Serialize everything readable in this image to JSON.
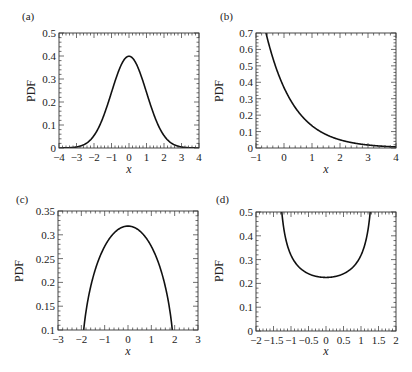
{
  "figure": {
    "colors": {
      "curve": "#111111",
      "frame": "#333333",
      "background": "#ffffff"
    }
  },
  "chart_data": [
    {
      "panel": "(a)",
      "type": "line",
      "title": "",
      "xlabel": "x",
      "ylabel": "PDF",
      "xlim": [
        -4,
        4
      ],
      "ylim": [
        0,
        0.5
      ],
      "xticks": [
        -4,
        -3,
        -2,
        -1,
        0,
        1,
        2,
        3,
        4
      ],
      "xtick_labels": [
        "−4",
        "−3",
        "−2",
        "−1",
        "0",
        "1",
        "2",
        "3",
        "4"
      ],
      "yticks": [
        0,
        0.1,
        0.2,
        0.3,
        0.4,
        0.5
      ],
      "ytick_labels": [
        "0",
        "0.1",
        "0.2",
        "0.3",
        "0.4",
        "0.5"
      ],
      "grid": false,
      "description": "Standard normal PDF, peak 0.399 at x=0",
      "x": [
        -4,
        -3.5,
        -3,
        -2.5,
        -2,
        -1.5,
        -1,
        -0.5,
        0,
        0.5,
        1,
        1.5,
        2,
        2.5,
        3,
        3.5,
        4
      ],
      "values": [
        0.0001,
        0.0009,
        0.0044,
        0.0175,
        0.054,
        0.1295,
        0.242,
        0.352,
        0.399,
        0.352,
        0.242,
        0.1295,
        0.054,
        0.0175,
        0.0044,
        0.0009,
        0.0001
      ]
    },
    {
      "panel": "(b)",
      "type": "line",
      "title": "",
      "xlabel": "x",
      "ylabel": "PDF",
      "xlim": [
        -1,
        4
      ],
      "ylim": [
        0,
        0.7
      ],
      "xticks": [
        -1,
        0,
        1,
        2,
        3,
        4
      ],
      "xtick_labels": [
        "−1",
        "0",
        "1",
        "2",
        "3",
        "4"
      ],
      "yticks": [
        0,
        0.1,
        0.2,
        0.3,
        0.4,
        0.5,
        0.6,
        0.7
      ],
      "ytick_labels": [
        "0",
        "0.1",
        "0.2",
        "0.3",
        "0.4",
        "0.5",
        "0.6",
        "0.7"
      ],
      "grid": false,
      "description": "Shifted exponential PDF exp(-(x+1)), exits top of frame near x=-0.65",
      "x": [
        -0.65,
        -0.5,
        0,
        0.5,
        1,
        1.5,
        2,
        2.5,
        3,
        3.5,
        4
      ],
      "values": [
        0.705,
        0.607,
        0.368,
        0.223,
        0.135,
        0.082,
        0.05,
        0.03,
        0.018,
        0.011,
        0.007
      ]
    },
    {
      "panel": "(c)",
      "type": "line",
      "title": "",
      "xlabel": "x",
      "ylabel": "PDF",
      "xlim": [
        -3,
        3
      ],
      "ylim": [
        0.1,
        0.35
      ],
      "xticks": [
        -3,
        -2,
        -1,
        0,
        1,
        2,
        3
      ],
      "xtick_labels": [
        "−3",
        "−2",
        "−1",
        "0",
        "1",
        "2",
        "3"
      ],
      "yticks": [
        0.1,
        0.15,
        0.2,
        0.25,
        0.3,
        0.35
      ],
      "ytick_labels": [
        "0.1",
        "0.15",
        "0.2",
        "0.25",
        "0.3",
        "0.35"
      ],
      "grid": false,
      "description": "Semicircle PDF sqrt(4-x^2)/(2*pi), peak 0.318 at x=0, crosses 0.1 near x=±1.9",
      "x": [
        -1.9,
        -1.75,
        -1.5,
        -1.25,
        -1,
        -0.75,
        -0.5,
        -0.25,
        0,
        0.25,
        0.5,
        0.75,
        1,
        1.25,
        1.5,
        1.75,
        1.9
      ],
      "values": [
        0.099,
        0.154,
        0.21,
        0.248,
        0.276,
        0.295,
        0.308,
        0.316,
        0.318,
        0.316,
        0.308,
        0.295,
        0.276,
        0.248,
        0.21,
        0.154,
        0.099
      ]
    },
    {
      "panel": "(d)",
      "type": "line",
      "title": "",
      "xlabel": "x",
      "ylabel": "PDF",
      "xlim": [
        -2,
        2
      ],
      "ylim": [
        0,
        0.5
      ],
      "xticks": [
        -2,
        -1.5,
        -1,
        -0.5,
        0,
        0.5,
        1,
        1.5,
        2
      ],
      "xtick_labels": [
        "−2",
        "−1.5",
        "−1",
        "−0.5",
        "0",
        "0.5",
        "1",
        "1.5",
        "2"
      ],
      "yticks": [
        0,
        0.1,
        0.2,
        0.3,
        0.4,
        0.5
      ],
      "ytick_labels": [
        "0",
        "0.1",
        "0.2",
        "0.3",
        "0.4",
        "0.5"
      ],
      "grid": false,
      "description": "Arcsine PDF 1/(pi*sqrt(2-x^2)), minimum 0.225 at x=0, exits top near x=±1.28",
      "x": [
        -1.28,
        -1.2,
        -1.1,
        -1,
        -0.75,
        -0.5,
        -0.25,
        0,
        0.25,
        0.5,
        0.75,
        1,
        1.1,
        1.2,
        1.28
      ],
      "values": [
        0.53,
        0.427,
        0.358,
        0.318,
        0.268,
        0.243,
        0.229,
        0.225,
        0.229,
        0.243,
        0.268,
        0.318,
        0.358,
        0.427,
        0.53
      ]
    }
  ],
  "panels": [
    {
      "label": "(a)",
      "xlabel": "x",
      "ylabel": "PDF"
    },
    {
      "label": "(b)",
      "xlabel": "x",
      "ylabel": "PDF"
    },
    {
      "label": "(c)",
      "xlabel": "x",
      "ylabel": "PDF"
    },
    {
      "label": "(d)",
      "xlabel": "x",
      "ylabel": "PDF"
    }
  ]
}
